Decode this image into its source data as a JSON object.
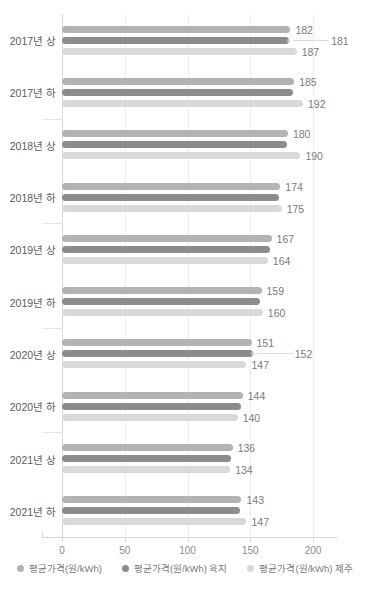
{
  "chart": {
    "title": "",
    "xlabel": "",
    "ylabel": "",
    "xticks": [
      "0",
      "50",
      "100",
      "150",
      "200"
    ]
  },
  "legend": {
    "items": [
      {
        "label": "평균가격(원/kWh)",
        "color": "#b3b3b3"
      },
      {
        "label": "평균가격(원/kWh) 육지",
        "color": "#8c8c8c"
      },
      {
        "label": "평균가격(원/kWh) 제주",
        "color": "#d9d9d9"
      }
    ]
  },
  "chart_data": {
    "type": "bar",
    "orientation": "horizontal",
    "title": "",
    "xlabel": "",
    "ylabel": "",
    "xlim": [
      0,
      200
    ],
    "xticks": [
      0,
      50,
      100,
      150,
      200
    ],
    "grid": true,
    "legend_position": "bottom",
    "categories": [
      "2017년 상",
      "2017년 하",
      "2018년 상",
      "2018년 하",
      "2019년 상",
      "2019년 하",
      "2020년 상",
      "2020년 하",
      "2021년 상",
      "2021년 하"
    ],
    "series": [
      {
        "name": "평균가격(원/kWh)",
        "color": "#b3b3b3",
        "values": [
          182,
          185,
          180,
          174,
          167,
          159,
          151,
          144,
          136,
          143
        ],
        "labels": [
          "182",
          "185",
          "180",
          "174",
          "167",
          "159",
          "151",
          "144",
          "136",
          "143"
        ]
      },
      {
        "name": "평균가격(원/kWh) 육지",
        "color": "#8c8c8c",
        "values": [
          181,
          184,
          179,
          173,
          166,
          158,
          152,
          143,
          135,
          142
        ],
        "labels": [
          "181",
          "",
          "",
          "",
          "",
          "",
          "152",
          "",
          "",
          ""
        ]
      },
      {
        "name": "평균가격(원/kWh) 제주",
        "color": "#d9d9d9",
        "values": [
          187,
          192,
          190,
          175,
          164,
          160,
          147,
          140,
          134,
          147
        ],
        "labels": [
          "187",
          "192",
          "190",
          "175",
          "164",
          "160",
          "147",
          "140",
          "134",
          "147"
        ]
      }
    ]
  }
}
